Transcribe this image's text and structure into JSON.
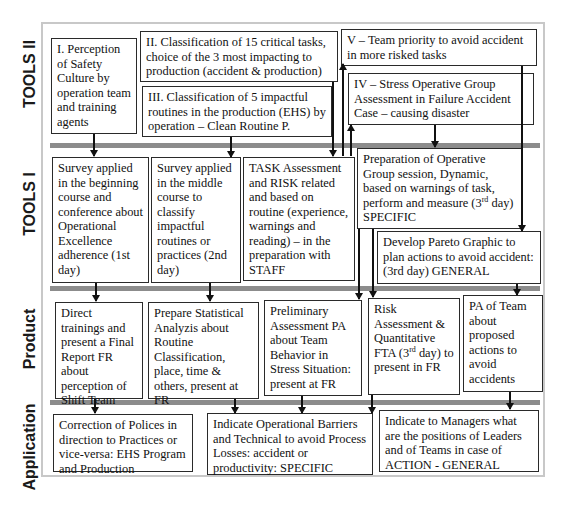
{
  "lanes": {
    "tools2": "TOOLS II",
    "tools1": "TOOLS I",
    "product": "Product",
    "application": "Application"
  },
  "tools2": {
    "box1": "I. Perception of Safety Culture by operation team and training agents",
    "box2": "II. Classification of 15 critical tasks, choice of the 3 most impacting to production (accident & production)",
    "box3": "III. Classification of 5 impactful routines in the production (EHS) by operation – Clean Routine P.",
    "box5": "V – Team priority to avoid accident in more risked tasks",
    "box4": "IV – Stress Operative Group Assessment in Failure Accident Case – causing disaster"
  },
  "tools1": {
    "box1": "Survey applied in the beginning course and conference about Operational Excellence adherence (1st day)",
    "box2": "Survey applied in the middle course to classify impactful routines or practices (2nd day)",
    "box3": "TASK Assessment and RISK related and based on routine (experience, warnings and reading) – in the preparation with STAFF",
    "box4_main": "Preparation of Operative Group session, Dynamic, based on warnings of task, perform and measure (3",
    "box4_sup": "rd",
    "box4_end": " day) SPECIFIC",
    "box5": "Develop Pareto Graphic to plan actions to avoid accident: (3rd day) GENERAL"
  },
  "product": {
    "box1": "Direct trainings and present a Final Report FR about perception of Shift Team",
    "box2": "Prepare Statistical Analyzis about Routine Classification, place, time & others, present at FR",
    "box3": "Preliminary Assessment PA about Team Behavior in Stress Situation: present at FR",
    "box4_main": "Risk Assessment & Quantitative FTA (3",
    "box4_sup": "rd",
    "box4_end": " day) to present in FR",
    "box5": "PA of Team about proposed actions to avoid accidents"
  },
  "application": {
    "box1": "Correction of Polices in direction to Practices or vice-versa: EHS Program and Production",
    "box2": "Indicate Operational Barriers and Technical to avoid Process Losses: accident or productivity: SPECIFIC",
    "box3": "Indicate to Managers what are the positions of Leaders and of Teams in case of ACTION - GENERAL"
  },
  "colors": {
    "separator": "#8c8c8c",
    "frame": "#c8c8c8",
    "box_border": "#2a2a2a"
  }
}
